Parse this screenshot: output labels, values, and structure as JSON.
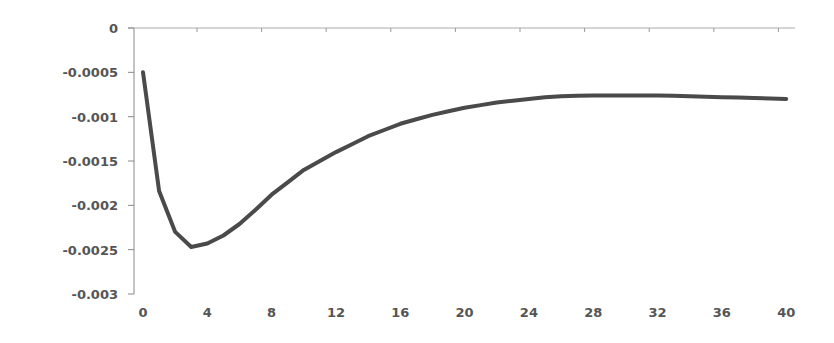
{
  "chart_data": {
    "type": "line",
    "title": "",
    "xlabel": "",
    "ylabel": "",
    "xlim": [
      0,
      40
    ],
    "ylim": [
      -0.003,
      0
    ],
    "grid": false,
    "legend": null,
    "x_ticks": [
      "0",
      "4",
      "8",
      "12",
      "16",
      "20",
      "24",
      "28",
      "32",
      "36",
      "40"
    ],
    "y_ticks": [
      "0",
      "-0.0005",
      "-0.001",
      "-0.0015",
      "-0.002",
      "-0.0025",
      "-0.003"
    ],
    "series": [
      {
        "name": "response",
        "color": "#4a4a4a",
        "x": [
          0,
          1,
          2,
          3,
          4,
          5,
          6,
          7,
          8,
          9,
          10,
          11,
          12,
          13,
          14,
          15,
          16,
          17,
          18,
          19,
          20,
          21,
          22,
          23,
          24,
          25,
          26,
          27,
          28,
          29,
          30,
          31,
          32,
          33,
          34,
          35,
          36,
          37,
          38,
          39,
          40
        ],
        "values": [
          -0.0005,
          -0.00184,
          -0.0023,
          -0.00247,
          -0.00243,
          -0.00234,
          -0.00221,
          -0.00205,
          -0.00188,
          -0.00174,
          -0.0016,
          -0.0015,
          -0.0014,
          -0.00131,
          -0.00122,
          -0.00115,
          -0.00108,
          -0.00103,
          -0.00098,
          -0.00094,
          -0.0009,
          -0.00087,
          -0.00084,
          -0.00082,
          -0.0008,
          -0.00078,
          -0.00077,
          -0.000765,
          -0.00076,
          -0.00076,
          -0.00076,
          -0.00076,
          -0.00076,
          -0.000765,
          -0.00077,
          -0.000775,
          -0.00078,
          -0.000785,
          -0.00079,
          -0.000795,
          -0.0008
        ]
      }
    ]
  }
}
